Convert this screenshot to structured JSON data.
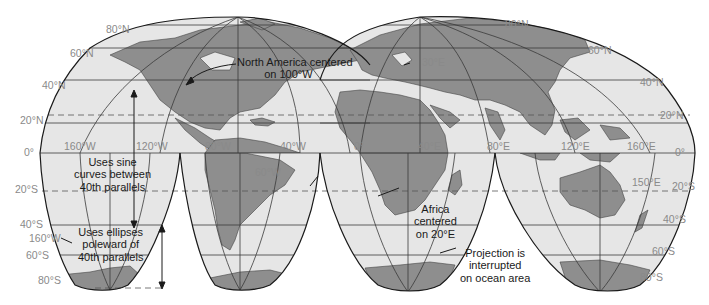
{
  "map": {
    "projection": "Goode's interrupted homolosine",
    "colors": {
      "ocean": "#e6e6e6",
      "land": "#8e8e8e",
      "outline": "#1a1a1a",
      "gridline": "#3a3a3a",
      "label_gray": "#8a8a8a",
      "annotation": "#1a1a1a",
      "background": "#ffffff"
    },
    "latitude_labels_left": [
      "80°N",
      "60°N",
      "40°N",
      "20°N",
      "0°",
      "20°S",
      "40°S",
      "60°S",
      "80°S"
    ],
    "latitude_labels_right": [
      "80°N",
      "60°N",
      "40°N",
      "20°N",
      "0°",
      "20°S",
      "40°S",
      "60°S",
      "80°S"
    ],
    "longitude_labels": [
      "160°W",
      "120°W",
      "80°W",
      "40°W",
      "0°",
      "40°E",
      "80°E",
      "120°E",
      "160°E"
    ],
    "extra_labels": {
      "lon_160w_south": "160°W",
      "lon_60w": "60°W",
      "lon_30e": "30°E",
      "lon_150e": "150°E"
    },
    "annotations": {
      "north_america": [
        "North America centered",
        "on 100°W"
      ],
      "sine_curves": [
        "Uses sine",
        "curves between",
        "40th parallels"
      ],
      "ellipses": [
        "Uses ellipses",
        "poleward of",
        "40th parallels"
      ],
      "africa": [
        "Africa",
        "centered",
        "on 20°E"
      ],
      "interrupted": [
        "Projection is",
        "interrupted",
        "on ocean area"
      ]
    }
  }
}
